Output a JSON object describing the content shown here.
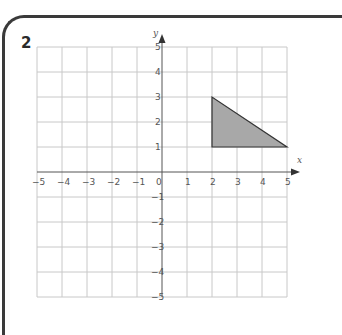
{
  "question": {
    "number": "2"
  },
  "chart_data": {
    "type": "diagram",
    "title": "",
    "xlabel": "x",
    "ylabel": "y",
    "xlim": [
      -5,
      5
    ],
    "ylim": [
      -5,
      5
    ],
    "grid": true,
    "x_ticks": [
      "-5",
      "-4",
      "-3",
      "-2",
      "-1",
      "0",
      "1",
      "2",
      "3",
      "4",
      "5"
    ],
    "y_ticks": [
      "5",
      "4",
      "3",
      "2",
      "1",
      "-1",
      "-2",
      "-3",
      "-4",
      "-5"
    ],
    "shapes": [
      {
        "type": "triangle",
        "vertices": [
          [
            2,
            1
          ],
          [
            2,
            3
          ],
          [
            5,
            1
          ]
        ],
        "fill": "#a8a8a8",
        "stroke": "#333333"
      }
    ]
  },
  "colors": {
    "grid": "#c8c8c8",
    "axis": "#555555",
    "frame": "#3a3a3a",
    "shape_fill": "#a8a8a8"
  }
}
